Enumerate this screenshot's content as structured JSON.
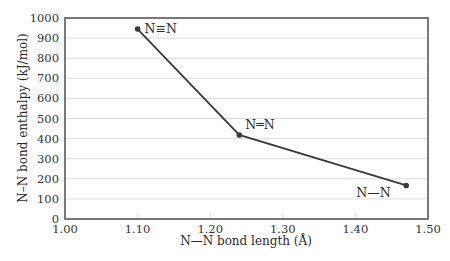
{
  "chart_data": {
    "type": "line",
    "title": "",
    "xlabel": "N—N bond length (Å)",
    "ylabel": "N–N bond enthalpy (kJ/mol)",
    "xlim": [
      1.0,
      1.5
    ],
    "ylim": [
      0,
      1000
    ],
    "xticks": [
      "1.00",
      "1.10",
      "1.20",
      "1.30",
      "1.40",
      "1.50"
    ],
    "yticks": [
      "0",
      "100",
      "200",
      "300",
      "400",
      "500",
      "600",
      "700",
      "800",
      "900",
      "1000"
    ],
    "grid": {
      "horizontal": true,
      "vertical": false
    },
    "legend": null,
    "series": [
      {
        "name": "N-N bonds",
        "x": [
          1.1,
          1.24,
          1.47
        ],
        "y": [
          945,
          418,
          167
        ],
        "color": "#3a3a3a"
      }
    ],
    "annotations": [
      {
        "text": "N≡N",
        "x": 1.1,
        "y": 945,
        "dx": 7,
        "dy": 0
      },
      {
        "text": "N═N",
        "x": 1.24,
        "y": 418,
        "dx": 6,
        "dy": -10
      },
      {
        "text": "N—N",
        "x": 1.47,
        "y": 167,
        "dx": -50,
        "dy": 8
      }
    ]
  },
  "colors": {
    "frame": "#6b6b6b",
    "grid": "#dcdcdc",
    "line": "#3a3a3a"
  }
}
